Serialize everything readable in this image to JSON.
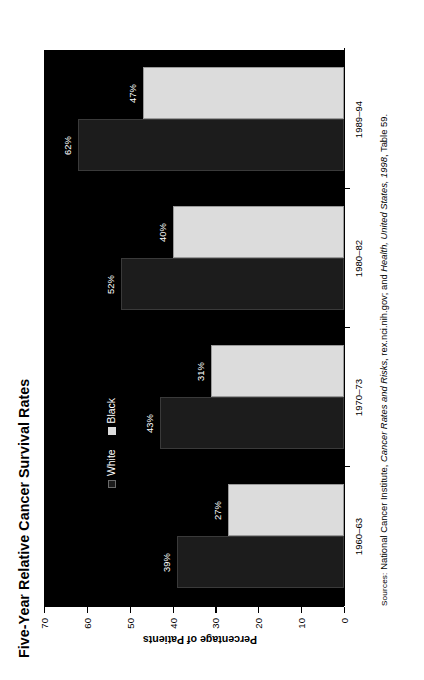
{
  "figure": {
    "title": "Five-Year Relative Cancer Survival Rates",
    "source_prefix": "Sources:",
    "source_part1": " National Cancer Institute, ",
    "source_italic1": "Cancer Rates and Risks",
    "source_part2": ", rex.nci.nih.gov; and ",
    "source_italic2": "Health, United States, 1998",
    "source_part3": ", Table 59."
  },
  "legend": {
    "items": [
      {
        "label": "White",
        "color": "#1c1c1c",
        "series_key": "white-series"
      },
      {
        "label": "Black",
        "color": "#dcdcdc",
        "series_key": "black-series"
      }
    ]
  },
  "axes": {
    "y_title": "Percentage of Patients",
    "y_ticks": [
      "0",
      "10",
      "20",
      "30",
      "40",
      "50",
      "60",
      "70"
    ],
    "y_min": 0,
    "y_max": 70,
    "x_categories": [
      "1960–63",
      "1970–73",
      "1980–82",
      "1989–94"
    ]
  },
  "chart_data": {
    "type": "bar",
    "title": "Five-Year Relative Cancer Survival Rates",
    "xlabel": "",
    "ylabel": "Percentage of Patients",
    "ylim": [
      0,
      70
    ],
    "ytick_step": 10,
    "grid": false,
    "legend_position": "inside-upper-left",
    "orientation": "vertical-grouped",
    "categories": [
      "1960–63",
      "1970–73",
      "1980–82",
      "1989–94"
    ],
    "series": [
      {
        "name": "White",
        "color": "#1c1c1c",
        "values": [
          39,
          43,
          52,
          62
        ],
        "data_labels": [
          "39%",
          "43%",
          "52%",
          "62%"
        ]
      },
      {
        "name": "Black",
        "color": "#dcdcdc",
        "values": [
          27,
          31,
          40,
          47
        ],
        "data_labels": [
          "27%",
          "31%",
          "40%",
          "47%"
        ]
      }
    ],
    "background": "#000000"
  }
}
